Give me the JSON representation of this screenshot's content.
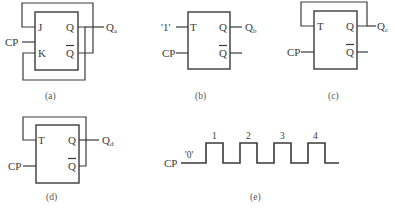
{
  "figures": {
    "a": {
      "caption": "(a)",
      "type": "JK flip-flop",
      "inputs": {
        "j": "J",
        "k": "K",
        "clock": "CP"
      },
      "outputs": {
        "q": "Q",
        "qbar": "Q",
        "out_main": "Q",
        "out_sub": "a"
      }
    },
    "b": {
      "caption": "(b)",
      "type": "T flip-flop",
      "const_input": "'1'",
      "inputs": {
        "t": "T",
        "clock": "CP"
      },
      "outputs": {
        "q": "Q",
        "qbar": "Q",
        "out_main": "Q",
        "out_sub": "b"
      }
    },
    "c": {
      "caption": "(c)",
      "type": "T flip-flop",
      "inputs": {
        "t": "T",
        "clock": "CP"
      },
      "outputs": {
        "q": "Q",
        "qbar": "Q",
        "out_main": "Q",
        "out_sub": "c"
      }
    },
    "d": {
      "caption": "(d)",
      "type": "T flip-flop",
      "inputs": {
        "t": "T",
        "clock": "CP"
      },
      "outputs": {
        "q": "Q",
        "qbar": "Q",
        "out_main": "Q",
        "out_sub": "d"
      }
    },
    "e": {
      "caption": "(e)",
      "type": "CP waveform",
      "signal_label": "CP",
      "initial_level": "'0'",
      "pulse_labels": [
        "1",
        "2",
        "3",
        "4"
      ]
    }
  },
  "colors": {
    "line": "#3a3a3a",
    "caption": "#555555",
    "background": "#ffffff"
  }
}
